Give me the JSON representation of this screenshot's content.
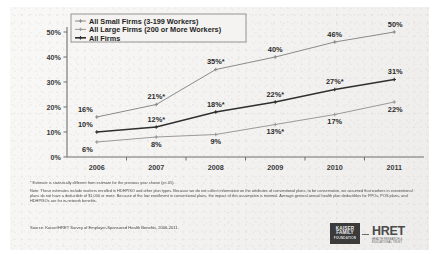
{
  "chart_data": {
    "type": "line",
    "title": "",
    "xlabel": "",
    "ylabel": "",
    "categories": [
      "2006",
      "2007",
      "2008",
      "2009",
      "2010",
      "2011"
    ],
    "ylim": [
      0,
      50
    ],
    "yticks": [
      "0%",
      "10%",
      "20%",
      "30%",
      "40%",
      "50%"
    ],
    "ytick_values": [
      0,
      10,
      20,
      30,
      40,
      50
    ],
    "grid": false,
    "legend_position": "top-left-inside",
    "series": [
      {
        "name": "All Small Firms (3-199 Workers)",
        "values": [
          16,
          21,
          35,
          40,
          46,
          50
        ],
        "labels": [
          "16%",
          "21%*",
          "35%*",
          "40%",
          "46%",
          "50%"
        ],
        "color": "#8a8a8a"
      },
      {
        "name": "All Large Firms (200 or More Workers)",
        "values": [
          6,
          8,
          9,
          13,
          17,
          22
        ],
        "labels": [
          "6%",
          "8%",
          "9%",
          "13%*",
          "17%",
          "22%"
        ],
        "color": "#9a9a9a"
      },
      {
        "name": "All Firms",
        "values": [
          10,
          12,
          18,
          22,
          27,
          31
        ],
        "labels": [
          "10%",
          "12%*",
          "18%*",
          "22%*",
          "27%*",
          "31%"
        ],
        "color": "#2f2f2f"
      }
    ]
  },
  "footnotes": {
    "significance": "* Estimate is statistically different from estimate for the previous year shown (p<.05).",
    "note": "Note: These estimates include workers enrolled in HDHP/SO and other plan types.  Because we do not collect information on the attributes of conventional plans, to be conservative, we assumed that workers in conventional plans do not have a deductible of $1,000 or more.  Because of the low enrollment in conventional plans, the impact of this assumption is minimal.  Average general annual health plan deductibles for PPOs, POS plans, and HDHP/SOs are for in-network benefits.",
    "source": "Source: Kaiser/HRET Survey of Employer-Sponsored Health Benefits, 2006-2011."
  },
  "logos": {
    "kff_line1": "KAISER",
    "kff_line2": "FAMILY",
    "kff_line3": "FOUNDATION",
    "hret_mark": "HRET",
    "hret_sub1": "HEALTH RESEARCH &",
    "hret_sub2": "EDUCATIONAL TRUST"
  }
}
